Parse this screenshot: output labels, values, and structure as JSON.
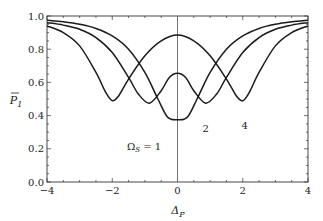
{
  "chart_data": {
    "type": "line",
    "title": "",
    "xlabel": "Δ_P",
    "ylabel": "P̄_1",
    "xlim": [
      -4,
      4
    ],
    "ylim": [
      0,
      1
    ],
    "grid": false,
    "legend": "none (inline curve annotations)",
    "x_ticks": [
      "-4",
      "-2",
      "0",
      "2",
      "4"
    ],
    "y_ticks": [
      "0.0",
      "0.2",
      "0.4",
      "0.6",
      "0.8",
      "1.0"
    ],
    "vertical_line_at_x": 0,
    "annotations": [
      {
        "text": "Ω_S = 1",
        "x": -1.55,
        "y": 0.19
      },
      {
        "text": "2",
        "x": 0.77,
        "y": 0.3
      },
      {
        "text": "4",
        "x": 1.96,
        "y": 0.32
      }
    ],
    "series": [
      {
        "name": "Ω_S = 1",
        "x": [
          -4,
          -3.5,
          -3,
          -2.5,
          -2,
          -1.5,
          -1,
          -0.6,
          -0.3,
          0,
          0.3,
          0.6,
          1,
          1.5,
          2,
          2.5,
          3,
          3.5,
          4
        ],
        "values": [
          0.975,
          0.965,
          0.95,
          0.925,
          0.88,
          0.8,
          0.66,
          0.5,
          0.39,
          0.375,
          0.39,
          0.5,
          0.66,
          0.8,
          0.88,
          0.925,
          0.95,
          0.965,
          0.975
        ]
      },
      {
        "name": "Ω_S = 2",
        "x": [
          -4,
          -3.5,
          -3,
          -2.5,
          -2,
          -1.5,
          -1.2,
          -0.86,
          -0.5,
          -0.25,
          0,
          0.25,
          0.5,
          0.86,
          1.2,
          1.5,
          2,
          2.5,
          3,
          3.5,
          4
        ],
        "values": [
          0.96,
          0.945,
          0.92,
          0.87,
          0.78,
          0.63,
          0.53,
          0.475,
          0.55,
          0.63,
          0.655,
          0.63,
          0.55,
          0.475,
          0.53,
          0.63,
          0.78,
          0.87,
          0.92,
          0.945,
          0.96
        ]
      },
      {
        "name": "Ω_S = 4",
        "x": [
          -4,
          -3.5,
          -3,
          -2.5,
          -2.2,
          -2,
          -1.8,
          -1.5,
          -1,
          -0.5,
          0,
          0.5,
          1,
          1.5,
          1.8,
          2,
          2.2,
          2.5,
          3,
          3.5,
          4
        ],
        "values": [
          0.94,
          0.9,
          0.82,
          0.66,
          0.54,
          0.49,
          0.52,
          0.62,
          0.76,
          0.85,
          0.885,
          0.85,
          0.76,
          0.62,
          0.52,
          0.49,
          0.54,
          0.66,
          0.82,
          0.9,
          0.94
        ]
      }
    ]
  },
  "colors": {
    "curve": "#1a1a1a",
    "axis": "#333333",
    "zero_line": "#666666",
    "background": "#ffffff"
  }
}
